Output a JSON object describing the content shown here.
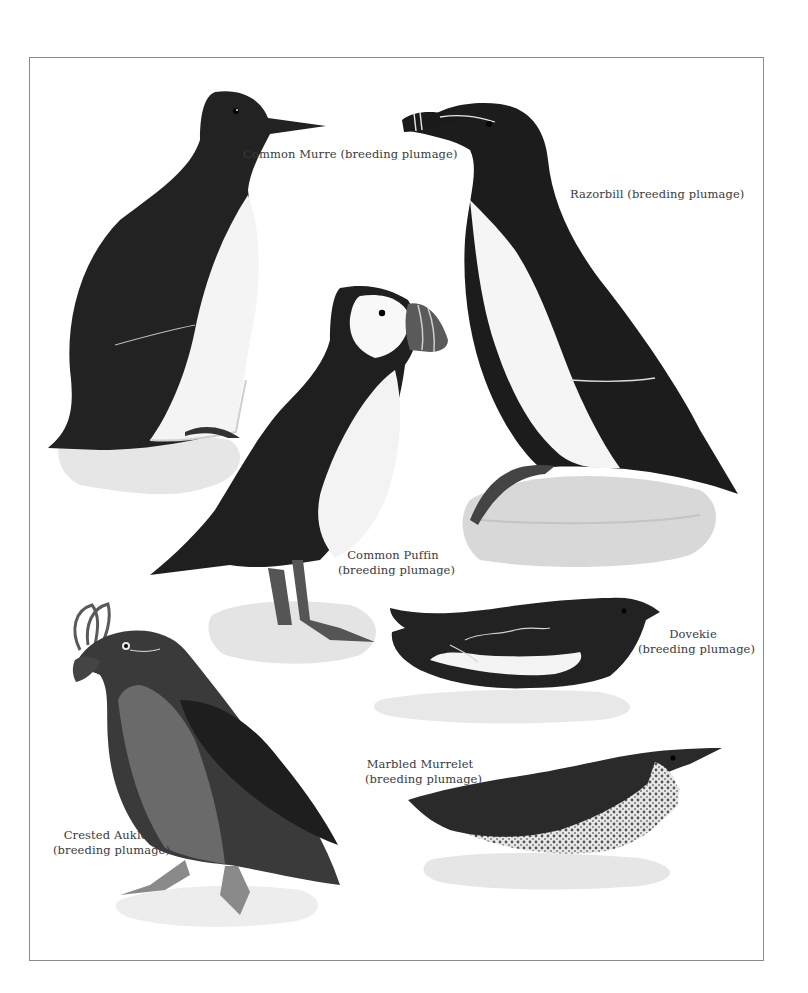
{
  "plate": {
    "frame_color": "#8a8a8a",
    "background": "#ffffff",
    "ink_dark": "#1e1e1e",
    "ink_mid": "#4a4a4a",
    "ink_light": "#d8d8d8"
  },
  "birds": [
    {
      "id": "common-murre",
      "name": "Common Murre",
      "plumage": "(breeding plumage)",
      "label": "Common Murre (breeding plumage)"
    },
    {
      "id": "razorbill",
      "name": "Razorbill",
      "plumage": "(breeding plumage)",
      "label": "Razorbill (breeding plumage)"
    },
    {
      "id": "common-puffin",
      "name": "Common Puffin",
      "plumage": "(breeding plumage)"
    },
    {
      "id": "dovekie",
      "name": "Dovekie",
      "plumage": "(breeding plumage)"
    },
    {
      "id": "marbled-murrelet",
      "name": "Marbled Murrelet",
      "plumage": "(breeding plumage)"
    },
    {
      "id": "crested-auklet",
      "name": "Crested Auklet",
      "plumage": "(breeding plumage)"
    }
  ]
}
